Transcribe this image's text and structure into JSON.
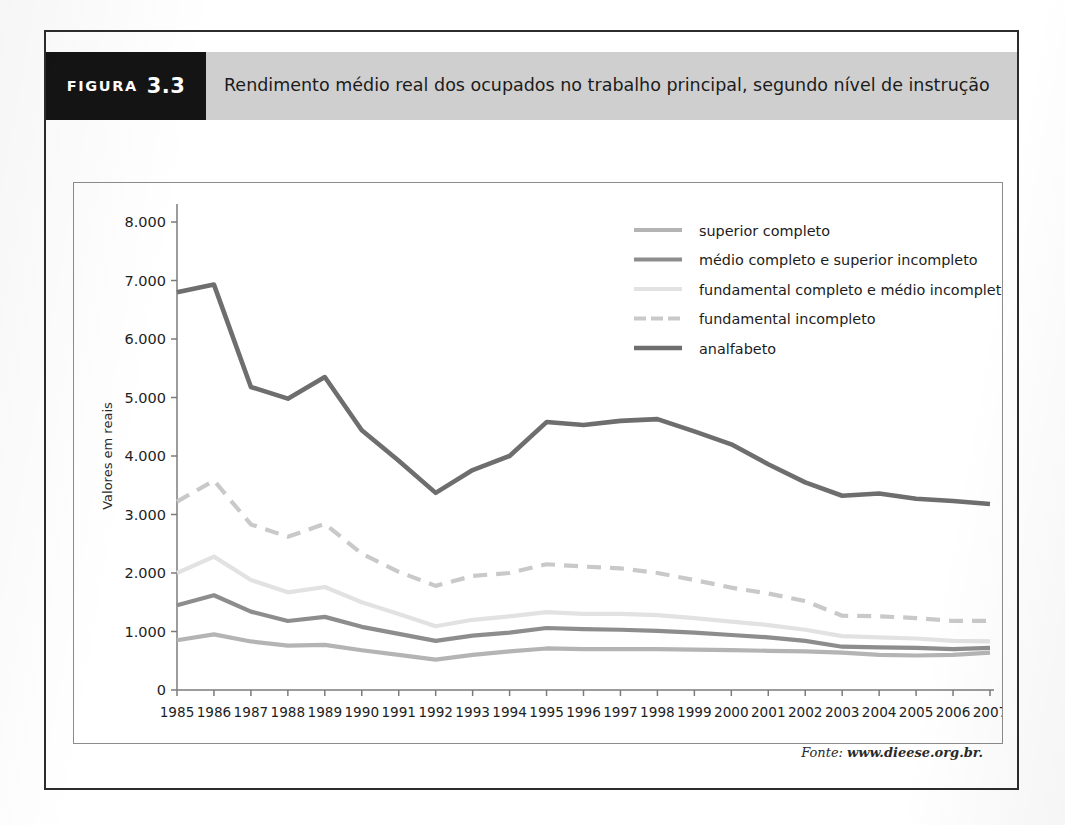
{
  "figure": {
    "tag_word": "FIGURA",
    "tag_number": "3.3",
    "title": "Rendimento médio real dos ocupados no trabalho principal, segundo nível de instrução",
    "source_prefix": "Fonte:",
    "source_url": "www.dieese.org.br."
  },
  "chart_data": {
    "type": "line",
    "title": "Rendimento médio real dos ocupados no trabalho principal, segundo nível de instrução",
    "xlabel": "",
    "ylabel": "Valores em reais",
    "x": [
      "1985",
      "1986",
      "1987",
      "1988",
      "1989",
      "1990",
      "1991",
      "1992",
      "1993",
      "1994",
      "1995",
      "1996",
      "1997",
      "1998",
      "1999",
      "2000",
      "2001",
      "2002",
      "2003",
      "2004",
      "2005",
      "2006",
      "2007"
    ],
    "ylim": [
      0,
      8000
    ],
    "yticks": [
      0,
      1000,
      2000,
      3000,
      4000,
      5000,
      6000,
      7000,
      8000
    ],
    "ytick_labels": [
      "0",
      "1.000",
      "2.000",
      "3.000",
      "4.000",
      "5.000",
      "6.000",
      "7.000",
      "8.000"
    ],
    "grid": false,
    "legend_position": "upper-right",
    "series": [
      {
        "name": "superior completo",
        "color": "#b4b4b4",
        "dash": "none",
        "width": 4.2,
        "values": [
          850,
          950,
          830,
          760,
          770,
          680,
          600,
          520,
          600,
          660,
          710,
          700,
          700,
          700,
          690,
          680,
          670,
          660,
          640,
          600,
          590,
          600,
          640
        ]
      },
      {
        "name": "médio completo e superior incompleto",
        "color": "#8d8d8d",
        "dash": "none",
        "width": 4.2,
        "values": [
          1450,
          1620,
          1340,
          1180,
          1250,
          1080,
          960,
          840,
          930,
          980,
          1060,
          1040,
          1030,
          1010,
          980,
          940,
          900,
          840,
          740,
          730,
          720,
          700,
          720
        ]
      },
      {
        "name": "fundamental completo e médio incompleto",
        "color": "#e2e2e2",
        "dash": "none",
        "width": 4.2,
        "values": [
          2000,
          2280,
          1880,
          1670,
          1760,
          1500,
          1300,
          1090,
          1200,
          1260,
          1330,
          1300,
          1300,
          1280,
          1230,
          1170,
          1110,
          1030,
          920,
          900,
          880,
          840,
          830
        ]
      },
      {
        "name": "fundamental incompleto",
        "color": "#c9c9c9",
        "dash": "14 9",
        "width": 4.2,
        "values": [
          3220,
          3580,
          2830,
          2620,
          2840,
          2330,
          2020,
          1780,
          1950,
          2000,
          2150,
          2110,
          2080,
          2000,
          1880,
          1750,
          1650,
          1520,
          1270,
          1260,
          1230,
          1180,
          1180
        ]
      },
      {
        "name": "analfabeto",
        "color": "#6e6e6e",
        "dash": "none",
        "width": 4.6,
        "values": [
          6800,
          6930,
          5180,
          4980,
          5350,
          4440,
          3920,
          3370,
          3760,
          4000,
          4580,
          4530,
          4600,
          4630,
          4420,
          4200,
          3860,
          3550,
          3320,
          3360,
          3270,
          3230,
          3180
        ]
      }
    ],
    "legend_order": [
      "superior completo",
      "médio completo e superior incompleto",
      "fundamental completo e médio incompleto",
      "fundamental incompleto",
      "analfabeto"
    ]
  }
}
